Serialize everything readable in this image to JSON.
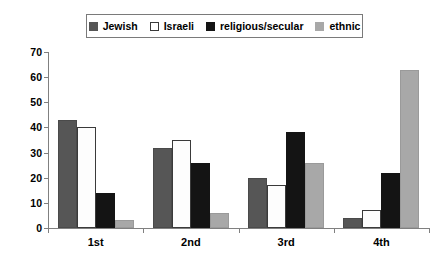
{
  "chart_data": {
    "type": "bar",
    "title": "",
    "xlabel": "",
    "ylabel": "",
    "categories": [
      "1st",
      "2nd",
      "3rd",
      "4th"
    ],
    "ylim": [
      0,
      70
    ],
    "yticks": [
      0,
      10,
      20,
      30,
      40,
      50,
      60,
      70
    ],
    "grid": false,
    "legend_position": "top",
    "series": [
      {
        "name": "Jewish",
        "color": "#565656",
        "values": [
          43,
          32,
          20,
          4
        ]
      },
      {
        "name": "Israeli",
        "color": "#ffffff",
        "values": [
          40,
          35,
          17,
          7
        ]
      },
      {
        "name": "religious/secular",
        "color": "#141414",
        "values": [
          14,
          26,
          38,
          22
        ]
      },
      {
        "name": "ethnic",
        "color": "#a8a8a8",
        "values": [
          3,
          6,
          26,
          63
        ]
      }
    ]
  },
  "legend": {
    "items": [
      {
        "label": "Jewish"
      },
      {
        "label": "Israeli"
      },
      {
        "label": "religious/secular"
      },
      {
        "label": "ethnic"
      }
    ]
  }
}
